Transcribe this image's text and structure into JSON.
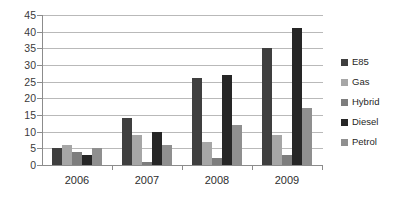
{
  "chart_data": {
    "type": "bar",
    "title": "",
    "subtitle": "",
    "xlabel": "",
    "ylabel": "",
    "categories": [
      "2006",
      "2007",
      "2008",
      "2009"
    ],
    "series": [
      {
        "name": "E85",
        "color": "#3f3f3f",
        "values": [
          5,
          14,
          26,
          35
        ]
      },
      {
        "name": "Gas",
        "color": "#a6a6a6",
        "values": [
          6,
          9,
          7,
          9
        ]
      },
      {
        "name": "Hybrid",
        "color": "#7d7d7d",
        "values": [
          4,
          1,
          2,
          3
        ]
      },
      {
        "name": "Diesel",
        "color": "#262626",
        "values": [
          3,
          10,
          27,
          41
        ]
      },
      {
        "name": "Petrol",
        "color": "#8f8f8f",
        "values": [
          5,
          6,
          12,
          17
        ]
      }
    ],
    "ylim": [
      0,
      45
    ],
    "ytick_step": 5,
    "yticks": [
      0,
      5,
      10,
      15,
      20,
      25,
      30,
      35,
      40,
      45
    ],
    "ytick_labels": [
      "0",
      "5",
      "10",
      "15",
      "20",
      "25",
      "30",
      "35",
      "40",
      "45"
    ],
    "grid": true,
    "grid_axis": "y",
    "legend_position": "right",
    "legend_entries": [
      "E85",
      "Gas",
      "Hybrid",
      "Diesel",
      "Petrol"
    ],
    "background_color": "#ffffff",
    "gridline_color": "#b9b9b9",
    "axis_color": "#8c8c8c"
  }
}
